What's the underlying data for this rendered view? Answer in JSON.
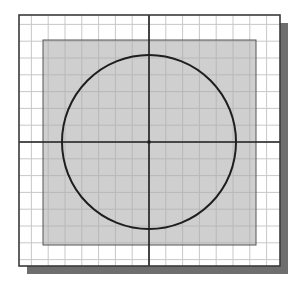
{
  "diagram": {
    "title": "",
    "grid": {
      "columns_each_side_of_origin": 8,
      "rows_each_side_of_origin": 7.5
    },
    "shapes": [
      {
        "type": "rectangle",
        "role": "drawing-area",
        "label": ""
      },
      {
        "type": "circle",
        "role": "sketch-circle",
        "center": "origin",
        "label": ""
      },
      {
        "type": "line",
        "role": "horizontal-axis",
        "label": ""
      },
      {
        "type": "line",
        "role": "vertical-axis",
        "label": ""
      },
      {
        "type": "point",
        "role": "origin-point",
        "label": ""
      }
    ],
    "colors": {
      "background": "#ffffff",
      "grid_line": "#c8c8c8",
      "frame": "#3a3a3a",
      "shadow": "#6e6e6e",
      "drawing_area_fill": "#cfcfcf",
      "drawing_area_grid": "#b8b8b8",
      "drawing_area_border": "#555555",
      "circle_stroke": "#1e1e1e",
      "axis_stroke": "#1e1e1e"
    }
  }
}
